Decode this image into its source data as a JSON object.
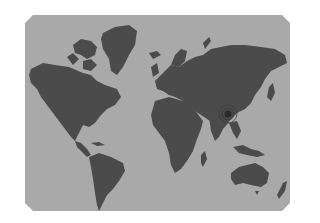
{
  "map": {
    "type": "world-map",
    "style": "grayscale-silhouette",
    "colors": {
      "ocean": "#a9a9a9",
      "land": "#4b4b4b",
      "background": "#ffffff",
      "marker": "#2a2a2a"
    },
    "marker": {
      "label": "location-marker",
      "region": "China"
    }
  }
}
